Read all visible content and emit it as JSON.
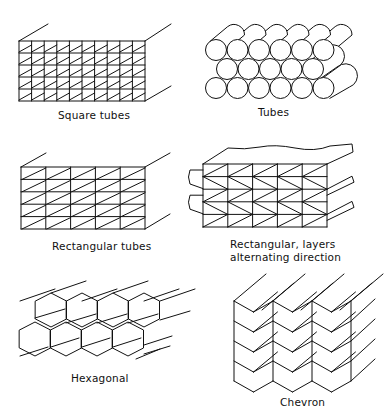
{
  "figure": {
    "panels": [
      {
        "id": "square-tubes",
        "label": "Square tubes",
        "grid_cols": 10,
        "grid_rows": 5
      },
      {
        "id": "tubes",
        "label": "Tubes",
        "rows": [
          6,
          5,
          6
        ]
      },
      {
        "id": "rectangular-tubes",
        "label": "Rectangular tubes",
        "grid_cols": 5,
        "grid_rows": 5
      },
      {
        "id": "rectangular-alternating",
        "label_line1": "Rectangular, layers",
        "label_line2": "alternating direction",
        "grid_cols": 5,
        "grid_rows": 5
      },
      {
        "id": "hexagonal",
        "label": "Hexagonal"
      },
      {
        "id": "chevron",
        "label": "Chevron",
        "cols": 3,
        "rows": 4
      }
    ],
    "line_color": "#111111",
    "background": "#ffffff"
  }
}
